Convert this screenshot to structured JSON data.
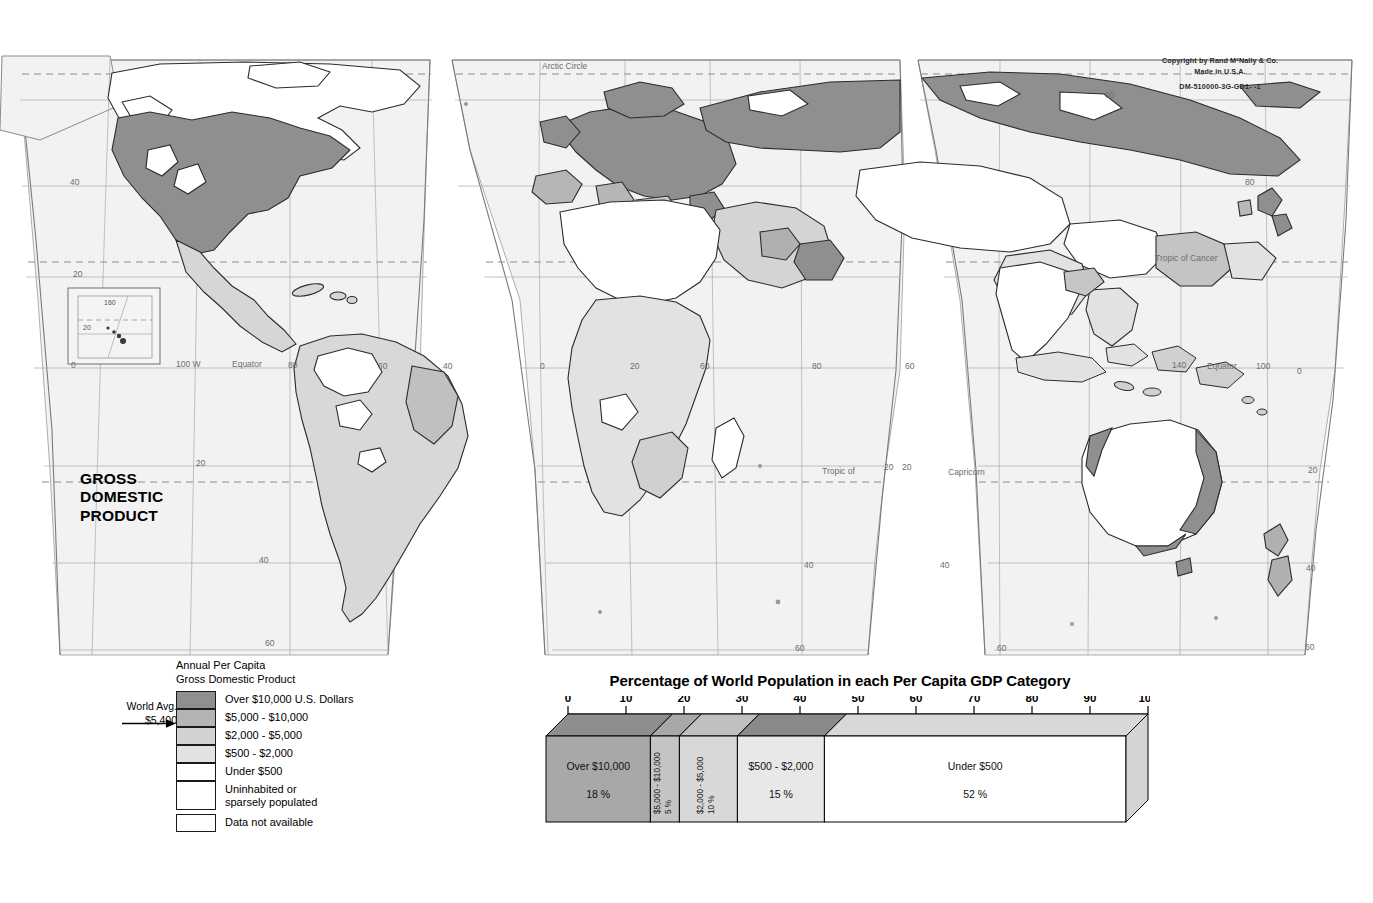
{
  "map": {
    "title_lines": [
      "GROSS",
      "DOMESTIC",
      "PRODUCT"
    ],
    "copyright_line1": "Copyright by Rand MᶜNally & Co.",
    "copyright_line2": "Made in U.S.A.",
    "copyright_code": "DM-510000-3G-GD1-  -1",
    "graticule_labels": [
      {
        "text": "Arctic Circle",
        "x": 542,
        "y": 69
      },
      {
        "text": "Tropic  of  Cancer",
        "x": 1155,
        "y": 261
      },
      {
        "text": "Tropic of",
        "x": 822,
        "y": 474
      },
      {
        "text": "Capricorn",
        "x": 948,
        "y": 475
      },
      {
        "text": "Equator",
        "x": 232,
        "y": 367
      },
      {
        "text": "Equator",
        "x": 1207,
        "y": 369
      },
      {
        "text": "100 W",
        "x": 176,
        "y": 367
      },
      {
        "text": "80",
        "x": 288,
        "y": 368
      },
      {
        "text": "60",
        "x": 378,
        "y": 369
      },
      {
        "text": "40",
        "x": 443,
        "y": 369
      },
      {
        "text": "0",
        "x": 540,
        "y": 369
      },
      {
        "text": "20",
        "x": 630,
        "y": 369
      },
      {
        "text": "60",
        "x": 700,
        "y": 369
      },
      {
        "text": "80",
        "x": 812,
        "y": 369
      },
      {
        "text": "60",
        "x": 905,
        "y": 369
      },
      {
        "text": "140",
        "x": 1172,
        "y": 368
      },
      {
        "text": "100",
        "x": 1256,
        "y": 369
      },
      {
        "text": "0",
        "x": 1297,
        "y": 374
      },
      {
        "text": "60",
        "x": 1105,
        "y": 98
      },
      {
        "text": "80",
        "x": 1245,
        "y": 185
      },
      {
        "text": "40",
        "x": 70,
        "y": 185
      },
      {
        "text": "20",
        "x": 73,
        "y": 277
      },
      {
        "text": "0",
        "x": 71,
        "y": 368
      },
      {
        "text": "20",
        "x": 196,
        "y": 466
      },
      {
        "text": "40",
        "x": 259,
        "y": 563
      },
      {
        "text": "60",
        "x": 265,
        "y": 646
      },
      {
        "text": "20",
        "x": 884,
        "y": 470
      },
      {
        "text": "20",
        "x": 902,
        "y": 470
      },
      {
        "text": "40",
        "x": 804,
        "y": 568
      },
      {
        "text": "60",
        "x": 795,
        "y": 651
      },
      {
        "text": "20",
        "x": 1308,
        "y": 473
      },
      {
        "text": "40",
        "x": 1306,
        "y": 571
      },
      {
        "text": "60",
        "x": 997,
        "y": 651
      },
      {
        "text": "40",
        "x": 940,
        "y": 568
      },
      {
        "text": "60",
        "x": 1305,
        "y": 650
      }
    ],
    "inset": {
      "label_lon": "160",
      "label_lat": "20"
    }
  },
  "legend": {
    "heading_line1": "Annual Per Capita",
    "heading_line2": "Gross Domestic Product",
    "world_avg_line1": "World Avg.",
    "world_avg_line2": "$5,400",
    "items": [
      {
        "label": "Over $10,000 U.S. Dollars",
        "color": "#8f8f8f"
      },
      {
        "label": "$5,000 - $10,000",
        "color": "#b4b4b4"
      },
      {
        "label": "$2,000 - $5,000",
        "color": "#d2d2d2"
      },
      {
        "label": "$500 - $2,000",
        "color": "#e2e2e2"
      },
      {
        "label": "Under $500",
        "color": "#ffffff"
      },
      {
        "label": "Uninhabited or\nsparsely populated",
        "color": "#ffffff"
      },
      {
        "label": "Data not available",
        "color": "#ffffff"
      }
    ]
  },
  "chart_data": {
    "type": "bar",
    "orientation": "horizontal-stacked",
    "title": "Percentage of World Population in each Per Capita GDP Category",
    "xlabel": "",
    "ylabel": "",
    "xlim": [
      0,
      100
    ],
    "grid": false,
    "legend_position": "in-bar",
    "tick_labels": [
      "0",
      "10",
      "20",
      "30",
      "40",
      "50",
      "60",
      "70",
      "80",
      "90",
      "100"
    ],
    "tick_values": [
      0,
      10,
      20,
      30,
      40,
      50,
      60,
      70,
      80,
      90,
      100
    ],
    "categories": [
      "Over $10,000",
      "$5,000 - $10,000",
      "$2,000 - $5,000",
      "$500 - $2,000",
      "Under $500"
    ],
    "values": [
      18,
      5,
      10,
      15,
      52
    ],
    "value_labels": [
      "18 %",
      "5 %",
      "10 %",
      "15 %",
      "52 %"
    ],
    "colors": [
      "#a8a8a8",
      "#c4c4c4",
      "#d8d8d8",
      "#e8e8e8",
      "#ffffff"
    ],
    "top_colors": [
      "#8e8e8e",
      "#a8a8a8",
      "#c0c0c0",
      "#8a8a8a",
      "#d8d8d8"
    ]
  }
}
